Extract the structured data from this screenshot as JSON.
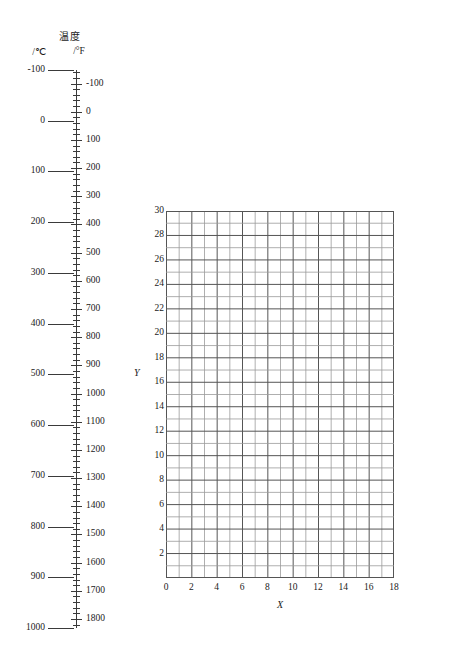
{
  "temperature_scale": {
    "title": "温度",
    "unit_celsius": "/℃",
    "unit_fahrenheit": "/°F",
    "celsius_labels": [
      "-100",
      "0",
      "100",
      "200",
      "300",
      "400",
      "500",
      "600",
      "700",
      "800",
      "900",
      "1000"
    ],
    "celsius_values": [
      -100,
      0,
      100,
      200,
      300,
      400,
      500,
      600,
      700,
      800,
      900,
      1000
    ],
    "fahrenheit_labels": [
      "-100",
      "0",
      "100",
      "200",
      "300",
      "400",
      "500",
      "600",
      "700",
      "800",
      "900",
      "1000",
      "1100",
      "1200",
      "1300",
      "1400",
      "1500",
      "1600",
      "1700",
      "1800"
    ],
    "fahrenheit_values": [
      -100,
      0,
      100,
      200,
      300,
      400,
      500,
      600,
      700,
      800,
      900,
      1000,
      1100,
      1200,
      1300,
      1400,
      1500,
      1600,
      1700,
      1800
    ],
    "fahrenheit_minor_step": 20,
    "fahrenheit_range": [
      -148,
      1832
    ]
  },
  "viscosity_scale": {
    "title": "黏度/mPa·s",
    "labels": [
      "0.1",
      "0.09",
      "0.08",
      "0.07",
      "0.06",
      "0.05",
      "0.04",
      "0.03",
      "0.02",
      "0.01",
      "0.009",
      "0.008",
      "0.007",
      "0.006",
      "0.005"
    ],
    "values": [
      0.1,
      0.09,
      0.08,
      0.07,
      0.06,
      0.05,
      0.04,
      0.03,
      0.02,
      0.01,
      0.009,
      0.008,
      0.007,
      0.006,
      0.005
    ],
    "scale_type": "log",
    "range": [
      0.005,
      0.1
    ]
  },
  "chart_data": {
    "type": "table",
    "title": "",
    "xlabel": "X",
    "ylabel": "Y",
    "xlim": [
      0,
      18
    ],
    "ylim": [
      0,
      30
    ],
    "x_ticks": [
      0,
      2,
      4,
      6,
      8,
      10,
      12,
      14,
      16,
      18
    ],
    "x_tick_labels": [
      "0",
      "2",
      "4",
      "6",
      "8",
      "10",
      "12",
      "14",
      "16",
      "18"
    ],
    "y_ticks": [
      2,
      4,
      6,
      8,
      10,
      12,
      14,
      16,
      18,
      20,
      22,
      24,
      26,
      28,
      30
    ],
    "y_tick_labels": [
      "2",
      "4",
      "6",
      "8",
      "10",
      "12",
      "14",
      "16",
      "18",
      "20",
      "22",
      "24",
      "26",
      "28",
      "30"
    ],
    "grid": true,
    "grid_step_x": 1,
    "grid_step_y": 1,
    "series": [],
    "values": [],
    "legend": []
  },
  "colors": {
    "ink": "#1a1a1a",
    "axis": "#3a3a3a",
    "grid_major": "#555555",
    "grid_minor": "#9a9a9a",
    "background": "#ffffff"
  }
}
